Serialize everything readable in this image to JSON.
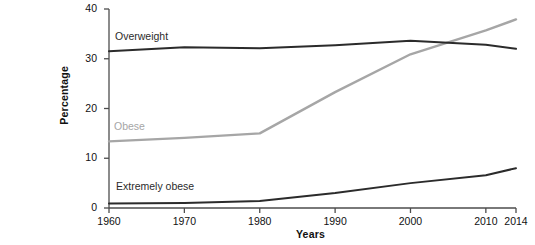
{
  "caption": {
    "title": "besity,",
    "body": " in\nreme\nge 20 in\n."
  },
  "chart": {
    "x_axis_title": "Years",
    "y_axis_title": "Percentage",
    "y_ticks": [
      "0",
      "10",
      "20",
      "30",
      "40"
    ],
    "x_ticks": [
      "1960",
      "1970",
      "1980",
      "1990",
      "2000",
      "2010",
      "2014"
    ],
    "series_labels": {
      "overweight": "Overweight",
      "obese": "Obese",
      "extremely_obese": "Extremely obese"
    },
    "colors": {
      "overweight": "#2b2b2b",
      "obese": "#a6a6a6",
      "extremely_obese": "#2b2b2b",
      "axis": "#4d4d4d"
    }
  },
  "chart_data": {
    "type": "line",
    "title": "",
    "xlabel": "Years",
    "ylabel": "Percentage",
    "xlim": [
      1960,
      2014
    ],
    "ylim": [
      0,
      40
    ],
    "xticks": [
      1960,
      1970,
      1980,
      1990,
      2000,
      2010,
      2014
    ],
    "yticks": [
      0,
      10,
      20,
      30,
      40
    ],
    "grid": false,
    "legend": "inline-labels",
    "x": [
      1960,
      1970,
      1980,
      1990,
      2000,
      2010,
      2014
    ],
    "series": [
      {
        "name": "Overweight",
        "color": "#2b2b2b",
        "values": [
          31.5,
          32.3,
          32.1,
          32.7,
          33.6,
          32.8,
          32.0
        ]
      },
      {
        "name": "Obese",
        "color": "#a6a6a6",
        "values": [
          13.4,
          14.1,
          15.0,
          23.3,
          30.9,
          35.7,
          37.9
        ]
      },
      {
        "name": "Extremely obese",
        "color": "#2b2b2b",
        "values": [
          0.9,
          1.0,
          1.4,
          3.0,
          5.0,
          6.6,
          8.0
        ]
      }
    ]
  }
}
